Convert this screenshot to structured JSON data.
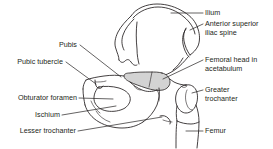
{
  "figure": {
    "background_color": "#ffffff",
    "line_color": "#231f20",
    "text_color": "#231f20",
    "shading_color": "#d3d3d3",
    "leader_line_color": "#231f20"
  },
  "labels": {
    "ilium": "Ilium",
    "anterior_superior_iliac_spine_line1": "Anterior superior",
    "anterior_superior_iliac_spine_line2": "iliac spine",
    "femoral_head_line1": "Femoral head in",
    "femoral_head_line2": "acetabulum",
    "greater_trochanter_line1": "Greater",
    "greater_trochanter_line2": "trochanter",
    "femur": "Femur",
    "pubis": "Pubis",
    "pubic_tubercle": "Pubic tubercle",
    "obturator_foramen": "Obturator foramen",
    "ischium": "Ischium",
    "lesser_trochanter": "Lesser trochanter"
  },
  "structures": [
    {
      "name": "ilium",
      "side": "right",
      "shaded": false
    },
    {
      "name": "anterior-superior-iliac-spine",
      "side": "right",
      "shaded": false
    },
    {
      "name": "femoral-head-in-acetabulum",
      "side": "right",
      "shaded": true
    },
    {
      "name": "greater-trochanter",
      "side": "right",
      "shaded": false
    },
    {
      "name": "femur",
      "side": "right",
      "shaded": false
    },
    {
      "name": "pubis",
      "side": "left",
      "shaded": false
    },
    {
      "name": "pubic-tubercle",
      "side": "left",
      "shaded": false
    },
    {
      "name": "obturator-foramen",
      "side": "left",
      "shaded": false
    },
    {
      "name": "ischium",
      "side": "left",
      "shaded": false
    },
    {
      "name": "lesser-trochanter",
      "side": "left",
      "shaded": false
    }
  ]
}
